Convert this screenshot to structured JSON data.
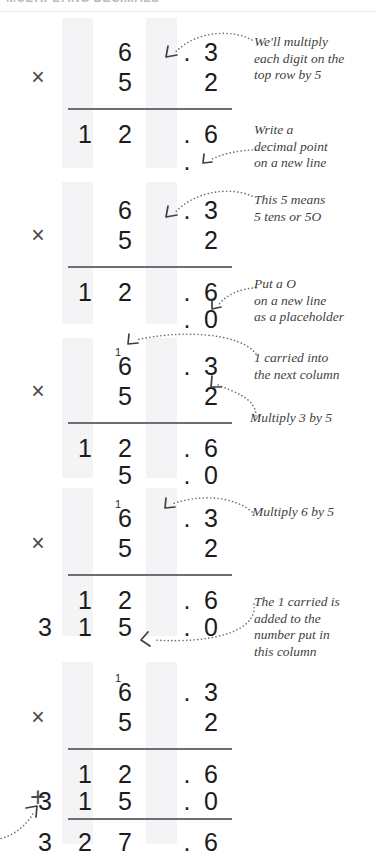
{
  "page": {
    "header_text": "MULTIPLYING DECIMALS",
    "header_color": "#b9bbbd",
    "rule_color": "#6d6e71",
    "band_color": "#f4f4f6",
    "digit_color": "#1c1c1e",
    "note_color": "#3f3f41"
  },
  "problem": {
    "multiplicand": "6.3",
    "multiplier": "52",
    "partial_1": "12.6",
    "partial_2": "315.0",
    "answer": "327.6",
    "times_symbol": "×",
    "plus_symbol": "+",
    "decimal_point": "."
  },
  "steps": [
    {
      "id": "step-1",
      "times": "×",
      "row_top": {
        "hund": "",
        "tens": "6",
        "dot": ".",
        "tnth": "3"
      },
      "row_bottom": {
        "hund": "",
        "tens": "5",
        "dot": "",
        "tnth": "2"
      },
      "result_1": {
        "hund": "1",
        "tens": "2",
        "dot": ".",
        "tnth": "6"
      },
      "result_2": {
        "hund": "",
        "tens": "",
        "dot": ".",
        "tnth": ""
      },
      "carry": "",
      "notes": [
        {
          "id": "note-multiply-each-digit",
          "lines": [
            "We'll multiply",
            "each digit on the",
            "top row by 5"
          ]
        },
        {
          "id": "note-write-decimal-point",
          "lines": [
            "Write a",
            "decimal point",
            "on a new line"
          ]
        }
      ]
    },
    {
      "id": "step-2",
      "times": "×",
      "row_top": {
        "hund": "",
        "tens": "6",
        "dot": ".",
        "tnth": "3"
      },
      "row_bottom": {
        "hund": "",
        "tens": "5",
        "dot": "",
        "tnth": "2"
      },
      "result_1": {
        "hund": "1",
        "tens": "2",
        "dot": ".",
        "tnth": "6"
      },
      "result_2": {
        "hund": "",
        "tens": "",
        "dot": ".",
        "tnth": "0"
      },
      "carry": "",
      "notes": [
        {
          "id": "note-five-means-fifty",
          "lines": [
            "This 5 means",
            "5 tens or 5O"
          ]
        },
        {
          "id": "note-put-a-zero",
          "lines": [
            "Put a O",
            "on a new line",
            "as a placeholder"
          ]
        }
      ]
    },
    {
      "id": "step-3",
      "times": "×",
      "row_top": {
        "hund": "",
        "tens": "6",
        "dot": ".",
        "tnth": "3"
      },
      "row_bottom": {
        "hund": "",
        "tens": "5",
        "dot": "",
        "tnth": "2"
      },
      "result_1": {
        "hund": "1",
        "tens": "2",
        "dot": ".",
        "tnth": "6"
      },
      "result_2": {
        "hund": "",
        "tens": "5",
        "dot": ".",
        "tnth": "0"
      },
      "carry": "1",
      "notes": [
        {
          "id": "note-one-carried",
          "lines": [
            "1 carried into",
            "the next column"
          ]
        },
        {
          "id": "note-multiply-3-by-5",
          "lines": [
            "Multiply 3 by 5"
          ]
        }
      ]
    },
    {
      "id": "step-4",
      "times": "×",
      "row_top": {
        "hund": "",
        "tens": "6",
        "dot": ".",
        "tnth": "3"
      },
      "row_bottom": {
        "hund": "",
        "tens": "5",
        "dot": "",
        "tnth": "2"
      },
      "result_1": {
        "hund": "1",
        "tens": "2",
        "dot": ".",
        "tnth": "6"
      },
      "result_2": {
        "hund": "3",
        "tens": "1",
        "dot": ".",
        "tnth": "0"
      },
      "result_2_hundreds": "3",
      "carry": "1",
      "notes": [
        {
          "id": "note-multiply-6-by-5",
          "lines": [
            "Multiply 6 by 5"
          ]
        },
        {
          "id": "note-one-carried-added",
          "lines": [
            "The 1 carried is",
            "added to the",
            "number put in",
            "this column"
          ]
        }
      ]
    },
    {
      "id": "step-5",
      "times": "×",
      "plus": "+",
      "row_top": {
        "hund": "",
        "tens": "6",
        "dot": ".",
        "tnth": "3"
      },
      "row_bottom": {
        "hund": "",
        "tens": "5",
        "dot": "",
        "tnth": "2"
      },
      "result_1": {
        "hund": "1",
        "tens": "2",
        "dot": ".",
        "tnth": "6"
      },
      "result_2": {
        "hund": "1",
        "tens": "5",
        "dot": ".",
        "tnth": "0"
      },
      "total": {
        "thou": "3",
        "hund": "2",
        "tens": "7",
        "dot": ".",
        "tnth": "6"
      },
      "carry": "1",
      "notes": []
    }
  ]
}
